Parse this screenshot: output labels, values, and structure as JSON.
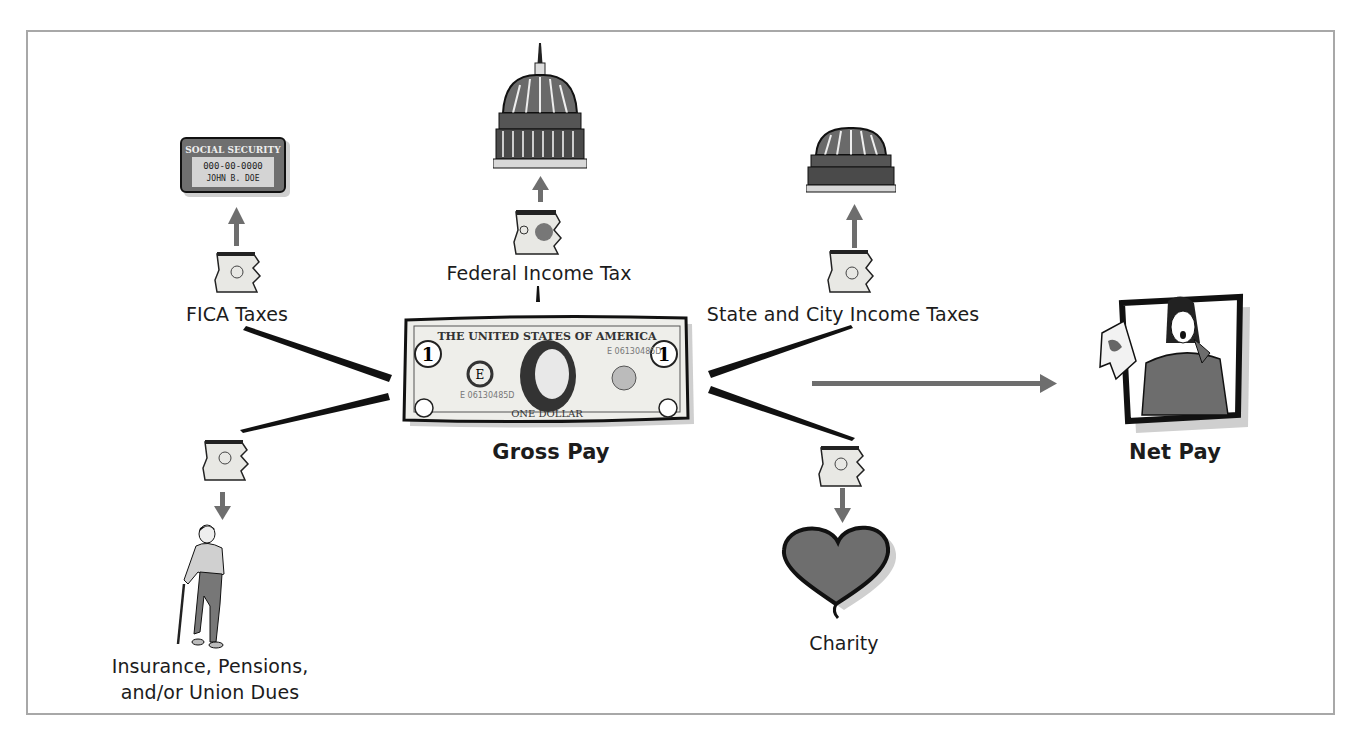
{
  "diagram": {
    "type": "payroll-deductions-flow",
    "center": {
      "label": "Gross Pay",
      "icon": "dollar-bill-icon",
      "bill_text": {
        "top": "THE UNITED STATES OF AMERICA",
        "bottom": "ONE DOLLAR",
        "serial": "E 06130485D",
        "seal_letter": "E",
        "denomination": "1"
      }
    },
    "result": {
      "label": "Net Pay",
      "icon": "surprised-woman-holding-money-icon"
    },
    "deductions": [
      {
        "id": "fica",
        "label": "FICA Taxes",
        "recipient_icon": "social-security-card-icon",
        "card": {
          "title": "SOCIAL SECURITY",
          "number": "000-00-0000",
          "name": "JOHN B. DOE"
        }
      },
      {
        "id": "federal",
        "label": "Federal Income Tax",
        "recipient_icon": "us-capitol-dome-icon"
      },
      {
        "id": "state-city",
        "label": "State and City Income Taxes",
        "recipient_icon": "state-capitol-dome-icon"
      },
      {
        "id": "insurance",
        "label_line1": "Insurance, Pensions,",
        "label_line2": "and/or Union Dues",
        "recipient_icon": "elderly-man-with-cane-icon"
      },
      {
        "id": "charity",
        "label": "Charity",
        "recipient_icon": "heart-icon"
      }
    ]
  },
  "colors": {
    "frame": "#a8a8a8",
    "arrow": "#6e6e6e",
    "ink": "#111111",
    "fill_gray": "#7a7a7a",
    "bill_fill": "#eeeeea"
  }
}
